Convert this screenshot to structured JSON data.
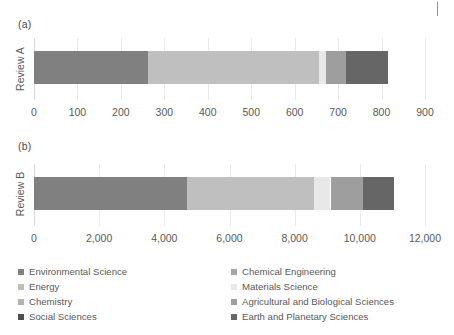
{
  "figure": {
    "panel_a_label": "(a)",
    "panel_b_label": "(b)",
    "category_a": "Review A",
    "category_b": "Review B"
  },
  "colors": {
    "environmental_science": "#808080",
    "chemical_engineering": "#a6a6a6",
    "energy": "#bfbfbf",
    "materials_science": "#e8e8e8",
    "chemistry": "#b3b3b3",
    "agricultural_and_biological_sciences": "#9e9e9e",
    "social_sciences": "#4d4d4d",
    "earth_and_planetary_sciences": "#666666",
    "gridline": "#e9e9e9",
    "text": "#595959"
  },
  "legend": {
    "left_column": [
      {
        "label": "Environmental Science",
        "color": "#808080"
      },
      {
        "label": "Energy",
        "color": "#bfbfbf"
      },
      {
        "label": "Chemistry",
        "color": "#b3b3b3"
      },
      {
        "label": "Social Sciences",
        "color": "#4d4d4d"
      }
    ],
    "right_column": [
      {
        "label": "Chemical Engineering",
        "color": "#a6a6a6"
      },
      {
        "label": "Materials Science",
        "color": "#e8e8e8"
      },
      {
        "label": "Agricultural and Biological Sciences",
        "color": "#9e9e9e"
      },
      {
        "label": "Earth and Planetary Sciences",
        "color": "#666666"
      }
    ]
  },
  "chart_data": [
    {
      "type": "bar",
      "orientation": "horizontal",
      "stacked": true,
      "title": "(a)",
      "xlabel": "",
      "ylabel": "",
      "categories": [
        "Review A"
      ],
      "xlim": [
        0,
        900
      ],
      "xticks": [
        0,
        100,
        200,
        300,
        400,
        500,
        600,
        700,
        800,
        900
      ],
      "xticklabels": [
        "0",
        "100",
        "200",
        "300",
        "400",
        "500",
        "600",
        "700",
        "800",
        "900"
      ],
      "grid": true,
      "legend_position": "bottom",
      "series": [
        {
          "name": "Environmental Science",
          "values": [
            262
          ],
          "color": "#808080"
        },
        {
          "name": "Energy",
          "values": [
            393
          ],
          "color": "#bfbfbf"
        },
        {
          "name": "Materials Science",
          "values": [
            17
          ],
          "color": "#e8e8e8"
        },
        {
          "name": "Agricultural and Biological Sciences",
          "values": [
            46
          ],
          "color": "#9e9e9e"
        },
        {
          "name": "Earth and Planetary Sciences",
          "values": [
            97
          ],
          "color": "#666666"
        }
      ],
      "total": 815
    },
    {
      "type": "bar",
      "orientation": "horizontal",
      "stacked": true,
      "title": "(b)",
      "xlabel": "",
      "ylabel": "",
      "categories": [
        "Review B"
      ],
      "xlim": [
        0,
        12000
      ],
      "xticks": [
        0,
        2000,
        4000,
        6000,
        8000,
        10000,
        12000
      ],
      "xticklabels": [
        "0",
        "2,000",
        "4,000",
        "6,000",
        "8,000",
        "10,000",
        "12,000"
      ],
      "grid": true,
      "legend_position": "bottom",
      "series": [
        {
          "name": "Environmental Science",
          "values": [
            4700
          ],
          "color": "#808080"
        },
        {
          "name": "Energy",
          "values": [
            3900
          ],
          "color": "#bfbfbf"
        },
        {
          "name": "Materials Science",
          "values": [
            500
          ],
          "color": "#e8e8e8"
        },
        {
          "name": "Agricultural and Biological Sciences",
          "values": [
            1000
          ],
          "color": "#9e9e9e"
        },
        {
          "name": "Earth and Planetary Sciences",
          "values": [
            950
          ],
          "color": "#666666"
        }
      ],
      "total": 11050
    }
  ]
}
